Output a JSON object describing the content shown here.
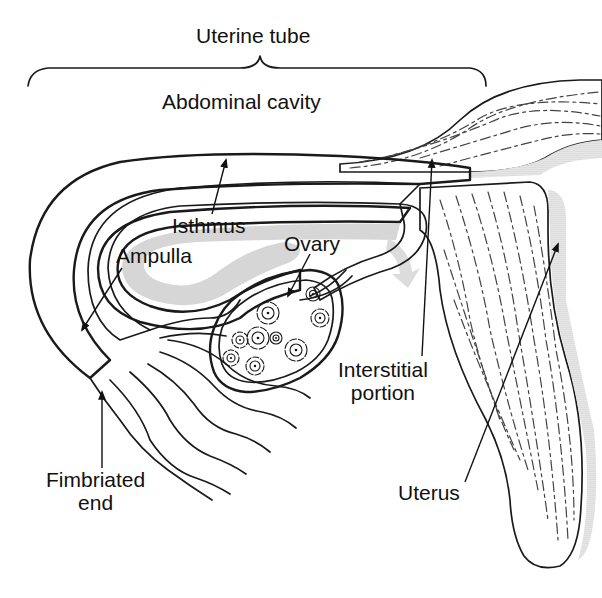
{
  "diagram": {
    "type": "anatomical-illustration",
    "colors": {
      "ink": "#1a1a1a",
      "stipple": "#b8b8b8",
      "lumen_shade": "#d4d4d4",
      "background": "#ffffff"
    },
    "labels": {
      "uterine_tube": "Uterine tube",
      "abdominal_cavity": "Abdominal cavity",
      "isthmus": "Isthmus",
      "ampulla": "Ampulla",
      "ovary": "Ovary",
      "interstitial_line1": "Interstitial",
      "interstitial_line2": "portion",
      "fimbriated_line1": "Fimbriated",
      "fimbriated_line2": "end",
      "uterus": "Uterus"
    },
    "annotations": [
      {
        "label": "Uterine tube",
        "indicator": "brace",
        "spans": "left edge to interstitial junction"
      },
      {
        "label": "Isthmus",
        "indicator": "arrow",
        "points_to": "upper tube wall"
      },
      {
        "label": "Ampulla",
        "indicator": "arrow",
        "points_to": "distal widened tube"
      },
      {
        "label": "Ovary",
        "indicator": "arrow",
        "points_to": "ovary interior"
      },
      {
        "label": "Interstitial portion",
        "indicator": "arrow",
        "points_to": "tube entering uterine wall"
      },
      {
        "label": "Fimbriated end",
        "indicator": "arrow",
        "points_to": "fimbriae"
      },
      {
        "label": "Uterus",
        "indicator": "arrow",
        "points_to": "uterine body"
      }
    ]
  }
}
